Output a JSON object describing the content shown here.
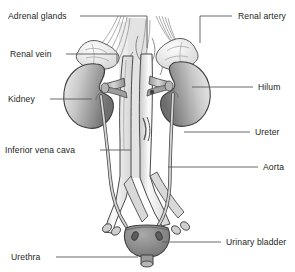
{
  "figure": {
    "background_color": "#ffffff",
    "outline_color": "#3a3a3a",
    "label_color": "#231f20",
    "leader_color": "#58595b",
    "spine_color": "#e0e0e0",
    "kidney_fill_light": "#e8e8e8",
    "kidney_fill_dark": "#6f6f6f",
    "vessel_fill": "#efefef",
    "vessel_shade": "#8d8d8d",
    "bladder_fill": "#8a8a8a",
    "adrenal_fill": "#f2f2f2"
  },
  "labels": [
    {
      "id": "adrenal-glands",
      "text": "Adrenal glands",
      "side": "left",
      "x": 8,
      "y": 12,
      "leader": {
        "x1": 80,
        "y1": 16,
        "x2": 147,
        "y2": 16,
        "x3": 147,
        "y3": 48
      }
    },
    {
      "id": "renal-vein",
      "text": "Renal vein",
      "side": "left",
      "x": 10,
      "y": 50,
      "leader": {
        "x1": 66,
        "y1": 54,
        "x2": 117,
        "y2": 54,
        "x3": 117,
        "y3": 63
      }
    },
    {
      "id": "kidney",
      "text": "Kidney",
      "side": "left",
      "x": 8,
      "y": 95,
      "leader": {
        "x1": 50,
        "y1": 99,
        "x2": 92,
        "y2": 99,
        "x3": 92,
        "y3": 99
      }
    },
    {
      "id": "inferior-vena-cava",
      "text": "Inferior vena cava",
      "side": "left",
      "x": 5,
      "y": 146,
      "leader": {
        "x1": 100,
        "y1": 150,
        "x2": 131,
        "y2": 150,
        "x3": 131,
        "y3": 150
      }
    },
    {
      "id": "urethra",
      "text": "Urethra",
      "side": "left",
      "x": 11,
      "y": 253,
      "leader": {
        "x1": 56,
        "y1": 257,
        "x2": 138,
        "y2": 257,
        "x3": 138,
        "y3": 257
      }
    },
    {
      "id": "renal-artery",
      "text": "Renal artery",
      "side": "right",
      "x": 238,
      "y": 12,
      "leader": {
        "x1": 232,
        "y1": 16,
        "x2": 200,
        "y2": 16,
        "x3": 200,
        "y3": 43
      }
    },
    {
      "id": "hilum",
      "text": "Hilum",
      "side": "right",
      "x": 258,
      "y": 83,
      "leader": {
        "x1": 253,
        "y1": 87,
        "x2": 192,
        "y2": 87,
        "x3": 192,
        "y3": 87
      }
    },
    {
      "id": "ureter",
      "text": "Ureter",
      "side": "right",
      "x": 255,
      "y": 128,
      "leader": {
        "x1": 250,
        "y1": 132,
        "x2": 184,
        "y2": 132,
        "x3": 184,
        "y3": 132
      }
    },
    {
      "id": "aorta",
      "text": "Aorta",
      "side": "right",
      "x": 263,
      "y": 163,
      "leader": {
        "x1": 258,
        "y1": 167,
        "x2": 168,
        "y2": 167,
        "x3": 168,
        "y3": 167
      }
    },
    {
      "id": "urinary-bladder",
      "text": "Urinary bladder",
      "side": "right",
      "x": 226,
      "y": 238,
      "leader": {
        "x1": 221,
        "y1": 242,
        "x2": 162,
        "y2": 242,
        "x3": 162,
        "y3": 242
      }
    }
  ],
  "structures": [
    {
      "id": "left-kidney",
      "name": "Kidney (viewer left)"
    },
    {
      "id": "right-kidney",
      "name": "Kidney (viewer right)"
    },
    {
      "id": "left-adrenal",
      "name": "Adrenal gland (viewer left)"
    },
    {
      "id": "right-adrenal",
      "name": "Adrenal gland (viewer right)"
    },
    {
      "id": "inferior-vena-cava",
      "name": "Inferior vena cava"
    },
    {
      "id": "aorta",
      "name": "Abdominal aorta"
    },
    {
      "id": "left-ureter",
      "name": "Ureter (viewer left)"
    },
    {
      "id": "right-ureter",
      "name": "Ureter (viewer right)"
    },
    {
      "id": "urinary-bladder",
      "name": "Urinary bladder"
    },
    {
      "id": "urethra",
      "name": "Urethra"
    },
    {
      "id": "vertebral-column",
      "name": "Vertebral column shadow"
    }
  ]
}
